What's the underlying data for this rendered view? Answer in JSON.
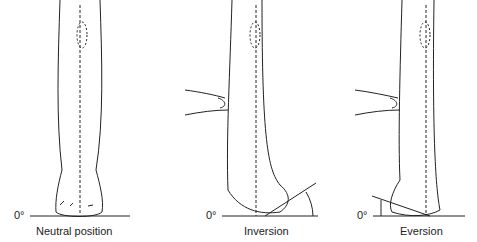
{
  "panels": [
    {
      "label": "Neutral position",
      "zero_label": "0°"
    },
    {
      "label": "Inversion",
      "zero_label": "0°"
    },
    {
      "label": "Eversion",
      "zero_label": "0°"
    }
  ]
}
